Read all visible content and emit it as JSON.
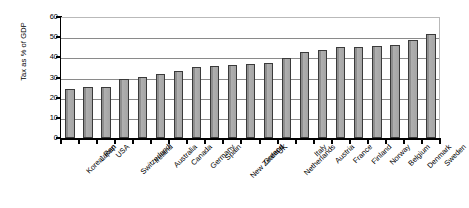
{
  "chart_data": {
    "type": "bar",
    "title": "",
    "xlabel": "",
    "ylabel": "Tax as % of GDP",
    "ylim": [
      0,
      60
    ],
    "ytick_labels": [
      "60",
      "50",
      "40",
      "30",
      "20",
      "10",
      "0"
    ],
    "yticks": [
      60,
      50,
      40,
      30,
      20,
      10,
      0
    ],
    "grid": true,
    "legend": "none",
    "orientation": "vertical",
    "bar_color": "#a8a8a8",
    "bar_edge_color": "#3a3a3a",
    "categories": [
      "Korea, Rep",
      "Japan",
      "USA",
      "Switzerland",
      "Ireland",
      "Australia",
      "Canada",
      "Germany",
      "Spain",
      "New Zealand",
      "Greece",
      "UK",
      "Netherlands",
      "Italy",
      "Austria",
      "France",
      "Finland",
      "Norway",
      "Belgium",
      "Denmark",
      "Sweden"
    ],
    "values": [
      24.5,
      25.2,
      25.2,
      29.5,
      30.2,
      31.5,
      33,
      35,
      35.5,
      36,
      36.5,
      37,
      39.5,
      42.5,
      43.5,
      45,
      45.2,
      45.5,
      46,
      48.5,
      51.5
    ]
  }
}
